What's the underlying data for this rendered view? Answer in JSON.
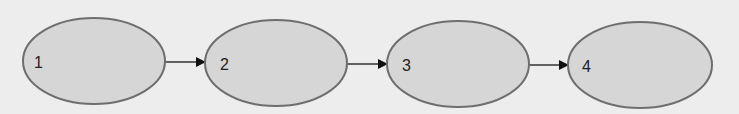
{
  "diagram": {
    "type": "flow",
    "nodes": [
      {
        "id": "1",
        "label": "1",
        "cx": 94,
        "cy": 61,
        "rx": 71,
        "ry": 43
      },
      {
        "id": "2",
        "label": "2",
        "cx": 276,
        "cy": 63,
        "rx": 71,
        "ry": 43
      },
      {
        "id": "3",
        "label": "3",
        "cx": 458,
        "cy": 64,
        "rx": 71,
        "ry": 43
      },
      {
        "id": "4",
        "label": "4",
        "cx": 640,
        "cy": 65,
        "rx": 72,
        "ry": 43
      }
    ],
    "edges": [
      {
        "from": "1",
        "to": "2"
      },
      {
        "from": "2",
        "to": "3"
      },
      {
        "from": "3",
        "to": "4"
      }
    ],
    "colors": {
      "background": "#ededed",
      "node_fill": "#d6d6d6",
      "node_stroke": "#6e6e6e",
      "arrow": "#111111"
    }
  }
}
